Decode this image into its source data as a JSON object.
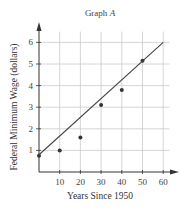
{
  "chart_data": {
    "type": "scatter",
    "title": "Graph A",
    "title_main": "Graph ",
    "title_italic": "A",
    "xlabel": "Years Since 1950",
    "ylabel": "Federal Minimum Wage (dollars)",
    "xlim": [
      0,
      65
    ],
    "ylim": [
      0,
      6.6
    ],
    "x_ticks": [
      10,
      20,
      30,
      40,
      50,
      60
    ],
    "y_ticks": [
      1,
      2,
      3,
      4,
      5,
      6
    ],
    "grid": true,
    "series": [
      {
        "name": "data",
        "type": "scatter",
        "x": [
          0,
          10,
          20,
          30,
          40,
          50
        ],
        "y": [
          0.75,
          1.0,
          1.6,
          3.1,
          3.8,
          5.15
        ]
      },
      {
        "name": "line of fit",
        "type": "line",
        "x": [
          0,
          60
        ],
        "y": [
          0.8,
          6.0
        ]
      }
    ],
    "colors": {
      "grid": "#cccccc",
      "axis": "#333333",
      "points": "#333333",
      "line": "#444444"
    }
  }
}
